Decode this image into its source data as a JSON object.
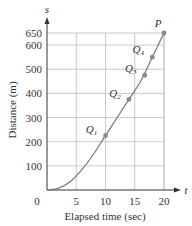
{
  "chart_data": {
    "type": "line",
    "title": "",
    "xlabel": "Elapsed time (sec)",
    "ylabel": "Distance (m)",
    "x_axis_symbol": "t",
    "y_axis_symbol": "s",
    "xlim": [
      0,
      20
    ],
    "ylim": [
      0,
      650
    ],
    "x_ticks": [
      "0",
      "5",
      "10",
      "15",
      "20"
    ],
    "y_ticks": [
      "100",
      "200",
      "300",
      "400",
      "500",
      "600",
      "650"
    ],
    "grid": true,
    "series": [
      {
        "name": "distance curve",
        "x": [
          0,
          2,
          4,
          6,
          8,
          10,
          12,
          14,
          16,
          18,
          20
        ],
        "y": [
          0,
          8,
          35,
          85,
          150,
          225,
          300,
          375,
          450,
          550,
          650
        ]
      }
    ],
    "points": [
      {
        "label": "Q1",
        "x": 10,
        "y": 225
      },
      {
        "label": "Q2",
        "x": 14,
        "y": 375
      },
      {
        "label": "Q3",
        "x": 16.7,
        "y": 475
      },
      {
        "label": "Q4",
        "x": 18,
        "y": 550
      },
      {
        "label": "P",
        "x": 20,
        "y": 650
      }
    ],
    "colors": {
      "curve": "#777777",
      "grid": "#bbbbbb",
      "axis": "#333333",
      "point": "#888888"
    }
  }
}
